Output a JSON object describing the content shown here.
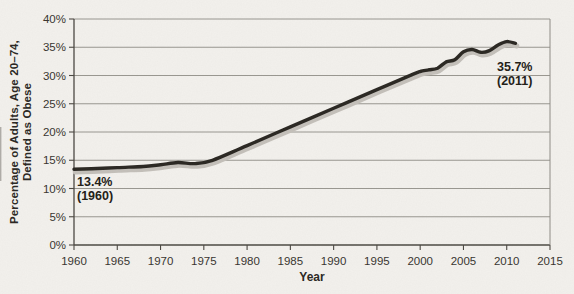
{
  "figure": {
    "y_axis_title_line1": "Percentage of Adults, Age 20–74,",
    "y_axis_title_line2": "Defined as Obese",
    "x_axis_title": "Year"
  },
  "annotations": {
    "start": {
      "value": "13.4%",
      "year": "(1960)"
    },
    "end": {
      "value": "35.7%",
      "year": "(2011)"
    }
  },
  "chart_data": {
    "type": "line",
    "title": "",
    "xlabel": "Year",
    "ylabel": "Percentage of Adults, Age 20–74, Defined as Obese",
    "xlim": [
      1960,
      2015
    ],
    "ylim": [
      0,
      40
    ],
    "x_ticks": [
      1960,
      1965,
      1970,
      1975,
      1980,
      1985,
      1990,
      1995,
      2000,
      2005,
      2010,
      2015
    ],
    "y_ticks": [
      0,
      5,
      10,
      15,
      20,
      25,
      30,
      35,
      40
    ],
    "y_tick_labels": [
      "0%",
      "5%",
      "10%",
      "15%",
      "20%",
      "25%",
      "30%",
      "35%",
      "40%"
    ],
    "grid": "horizontal",
    "legend": "none",
    "series": [
      {
        "name": "Percent of adults defined as obese",
        "points": [
          [
            1960,
            13.4
          ],
          [
            1962,
            13.5
          ],
          [
            1965,
            13.7
          ],
          [
            1968,
            13.9
          ],
          [
            1970,
            14.2
          ],
          [
            1972,
            14.6
          ],
          [
            1974,
            14.4
          ],
          [
            1976,
            15.0
          ],
          [
            1980,
            17.6
          ],
          [
            1985,
            20.9
          ],
          [
            1990,
            24.2
          ],
          [
            1995,
            27.5
          ],
          [
            1999,
            30.1
          ],
          [
            2000,
            30.7
          ],
          [
            2001,
            31.0
          ],
          [
            2002,
            31.3
          ],
          [
            2003,
            32.4
          ],
          [
            2004,
            32.8
          ],
          [
            2005,
            34.2
          ],
          [
            2006,
            34.6
          ],
          [
            2007,
            34.1
          ],
          [
            2008,
            34.4
          ],
          [
            2009,
            35.4
          ],
          [
            2010,
            36.0
          ],
          [
            2011,
            35.7
          ]
        ]
      }
    ],
    "colors": {
      "line": "#2a2722",
      "line_shadow": "#c4c0ba",
      "grid": "#8f8c86",
      "axis": "#4b4842",
      "text": "#37342f",
      "background": "#f3f1ed"
    }
  }
}
